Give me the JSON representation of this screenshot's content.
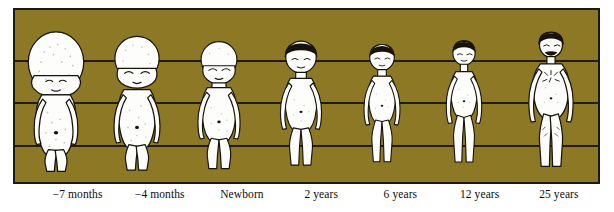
{
  "figure": {
    "panel": {
      "background_color": "#8d7826",
      "border_color": "#1d1a10",
      "gridline_color": "#201c10",
      "gridline_count": 4,
      "gridline_y_positions": [
        52,
        94,
        137,
        176
      ]
    },
    "label_strip": {
      "text_color": "#0d0d0d",
      "background_color": "#ffffff"
    },
    "stages": [
      {
        "id": "fetus-7-months",
        "label": "−7 months",
        "age_value": -7,
        "age_unit": "months",
        "height_fraction": 0.93,
        "head_fraction_of_body": 0.5,
        "skin_color": "#fdfdfb",
        "hair_color": "none",
        "center_x_pct": 11.0,
        "label_center_x_pct": 11.0
      },
      {
        "id": "fetus-4-months",
        "label": "−4 months",
        "age_value": -4,
        "age_unit": "months",
        "height_fraction": 0.9,
        "head_fraction_of_body": 0.38,
        "skin_color": "#fdfdfb",
        "hair_color": "none",
        "center_x_pct": 25.0,
        "label_center_x_pct": 25.0
      },
      {
        "id": "newborn",
        "label": "Newborn",
        "age_value": 0,
        "age_unit": "years",
        "height_fraction": 0.86,
        "head_fraction_of_body": 0.27,
        "skin_color": "#fdfdfb",
        "hair_color": "none",
        "center_x_pct": 39.0,
        "label_center_x_pct": 39.0
      },
      {
        "id": "age-2",
        "label": "2 years",
        "age_value": 2,
        "age_unit": "years",
        "height_fraction": 0.88,
        "head_fraction_of_body": 0.22,
        "skin_color": "#fdfdfb",
        "hair_color": "#17140d",
        "center_x_pct": 53.0,
        "label_center_x_pct": 52.5
      },
      {
        "id": "age-6",
        "label": "6 years",
        "age_value": 6,
        "age_unit": "years",
        "height_fraction": 0.88,
        "head_fraction_of_body": 0.18,
        "skin_color": "#fdfdfb",
        "hair_color": "#17140d",
        "center_x_pct": 66.5,
        "label_center_x_pct": 66.0
      },
      {
        "id": "age-12",
        "label": "12 years",
        "age_value": 12,
        "age_unit": "years",
        "height_fraction": 0.9,
        "head_fraction_of_body": 0.16,
        "skin_color": "#fdfdfb",
        "hair_color": "#17140d",
        "center_x_pct": 80.0,
        "label_center_x_pct": 79.5
      },
      {
        "id": "age-25",
        "label": "25 years",
        "age_value": 25,
        "age_unit": "years",
        "height_fraction": 0.93,
        "head_fraction_of_body": 0.13,
        "skin_color": "#fdfdfb",
        "hair_color": "#17140d",
        "facial_hair": "moustache",
        "center_x_pct": 93.5,
        "label_center_x_pct": 93.0
      }
    ]
  }
}
